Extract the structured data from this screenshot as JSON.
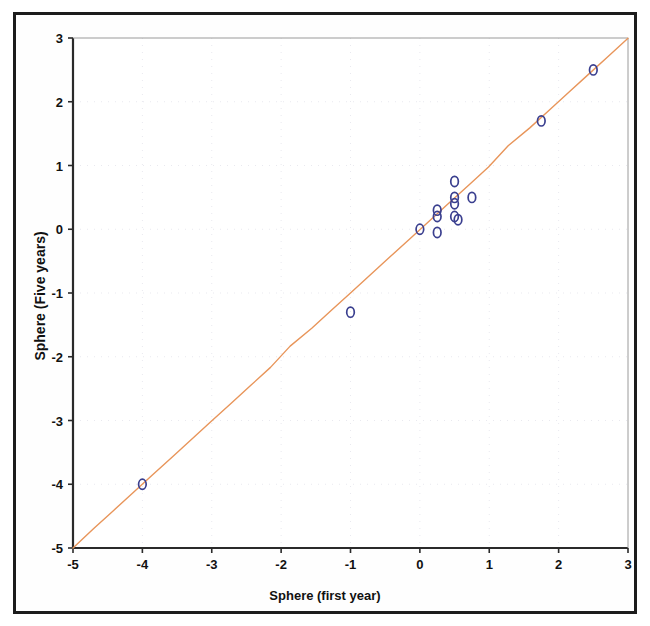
{
  "figure": {
    "kind": "scatter-plot",
    "background_color": "#ffffff",
    "frame_color": "#1c1c1c"
  },
  "chart_data": {
    "type": "scatter",
    "title": "",
    "xlabel": "Sphere (first year)",
    "ylabel": "Sphere (Five years)",
    "xlim": [
      -5,
      3
    ],
    "ylim": [
      -5,
      3
    ],
    "xticks": [
      -5,
      -4,
      -3,
      -2,
      -1,
      0,
      1,
      2,
      3
    ],
    "xtick_labels": [
      "-5",
      "-4",
      "-3",
      "-2",
      "-1",
      "0",
      "1",
      "2",
      "3"
    ],
    "yticks": [
      -5,
      -4,
      -3,
      -2,
      -1,
      0,
      1,
      2,
      3
    ],
    "ytick_labels": [
      "-5",
      "-4",
      "-3",
      "-2",
      "-1",
      "0",
      "1",
      "2",
      "3"
    ],
    "grid": false,
    "legend": "none",
    "marker": {
      "shape": "open-circle",
      "edge_color": "#3a3f8f",
      "face_color": "none",
      "size_px": 9
    },
    "reference_line": {
      "name": "identity-line",
      "color": "#e8955a",
      "from": [
        -5,
        -5
      ],
      "to": [
        3,
        3
      ],
      "width_px": 1.4
    },
    "x": [
      -4.0,
      -1.0,
      0.0,
      0.25,
      0.25,
      0.25,
      0.5,
      0.5,
      0.5,
      0.5,
      0.55,
      0.75,
      1.75,
      2.5
    ],
    "y": [
      -4.0,
      -1.3,
      0.0,
      0.3,
      0.2,
      -0.05,
      0.75,
      0.5,
      0.4,
      0.2,
      0.15,
      0.5,
      1.7,
      2.5
    ],
    "points": [
      {
        "x": -4.0,
        "y": -4.0
      },
      {
        "x": -1.0,
        "y": -1.3
      },
      {
        "x": 0.0,
        "y": 0.0
      },
      {
        "x": 0.25,
        "y": 0.3
      },
      {
        "x": 0.25,
        "y": 0.2
      },
      {
        "x": 0.25,
        "y": -0.05
      },
      {
        "x": 0.5,
        "y": 0.75
      },
      {
        "x": 0.5,
        "y": 0.5
      },
      {
        "x": 0.5,
        "y": 0.4
      },
      {
        "x": 0.5,
        "y": 0.2
      },
      {
        "x": 0.55,
        "y": 0.15
      },
      {
        "x": 0.75,
        "y": 0.5
      },
      {
        "x": 1.75,
        "y": 1.7
      },
      {
        "x": 2.5,
        "y": 2.5
      }
    ]
  },
  "plot_geometry": {
    "left_px": 73,
    "right_px": 628,
    "top_px": 38,
    "bottom_px": 548
  }
}
